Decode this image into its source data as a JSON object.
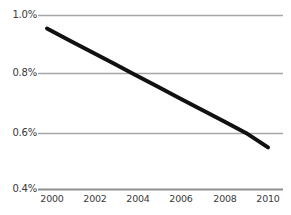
{
  "chart_data": {
    "type": "line",
    "title": "",
    "subtitle": "",
    "xlabel": "",
    "ylabel": "",
    "x": [
      2000,
      2001,
      2002,
      2003,
      2004,
      2005,
      2006,
      2007,
      2008,
      2009,
      2010
    ],
    "series": [
      {
        "name": "",
        "values": [
          0.955,
          0.915,
          0.875,
          0.835,
          0.795,
          0.755,
          0.715,
          0.675,
          0.635,
          0.595,
          0.545
        ],
        "color": "#111111",
        "line_width": 4
      }
    ],
    "categories": [
      "2000",
      "2001",
      "2002",
      "2003",
      "2004",
      "2005",
      "2006",
      "2007",
      "2008",
      "2009",
      "2010"
    ],
    "xlim": [
      2000,
      2010
    ],
    "ylim": [
      0.4,
      1.0
    ],
    "xticks": [
      2000,
      2002,
      2004,
      2006,
      2008,
      2010
    ],
    "xtick_labels": [
      "2000",
      "2002",
      "2004",
      "2006",
      "2008",
      "2010"
    ],
    "yticks": [
      0.4,
      0.6,
      0.8,
      1.0
    ],
    "ytick_labels": [
      "0.4%",
      "0.6%",
      "0.8%",
      "1.0%"
    ],
    "grid": true,
    "grid_axis": "y",
    "grid_color": "#a6a6a6",
    "legend": false,
    "legend_position": "none",
    "background_color": "#ffffff",
    "annotations": []
  },
  "axes": {
    "y_labels": {
      "t3": "1.0%",
      "t2": "0.8%",
      "t1": "0.6%",
      "t0": "0.4%"
    },
    "x_labels": {
      "t0": "2000",
      "t1": "2002",
      "t2": "2004",
      "t3": "2006",
      "t4": "2008",
      "t5": "2010"
    }
  }
}
